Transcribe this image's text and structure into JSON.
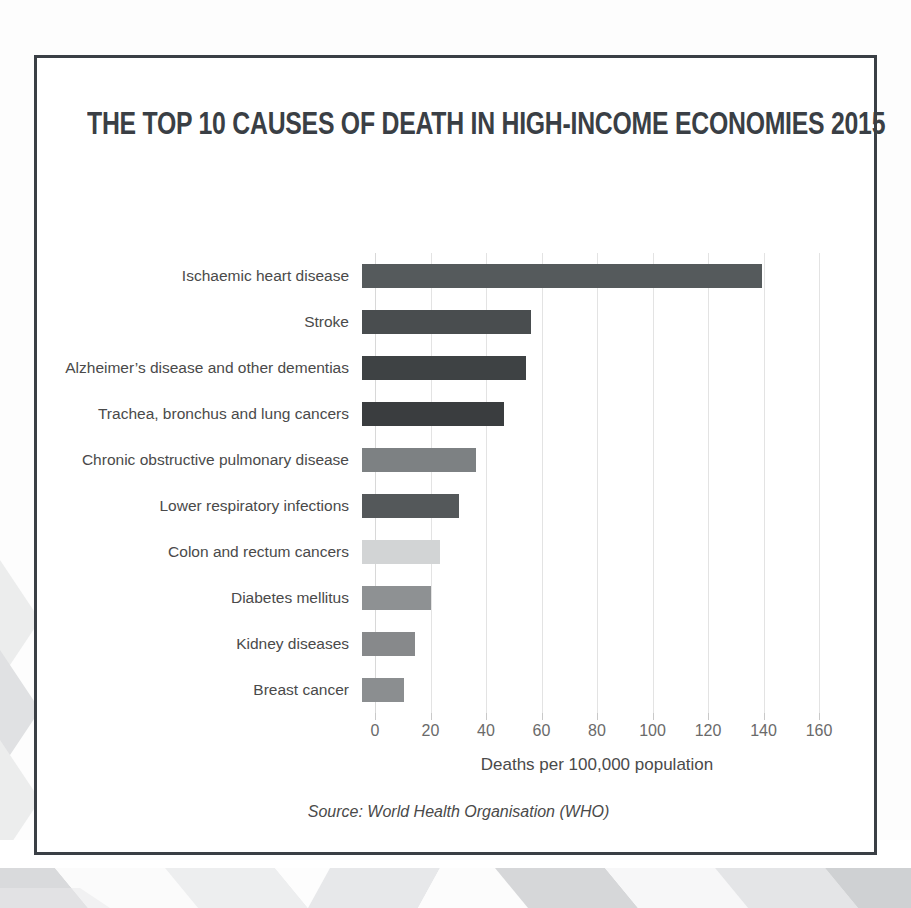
{
  "card": {
    "title": "THE TOP 10 CAUSES OF DEATH IN HIGH-INCOME ECONOMIES 2015",
    "source": "Source: World Health Organisation (WHO)"
  },
  "chart_data": {
    "type": "bar",
    "orientation": "horizontal",
    "title": "THE TOP 10 CAUSES OF DEATH IN HIGH-INCOME ECONOMIES 2015",
    "xlabel": "Deaths per 100,000  population",
    "ylabel": "",
    "xlim": [
      0,
      160
    ],
    "xticks": [
      0,
      20,
      40,
      60,
      80,
      100,
      120,
      140,
      160
    ],
    "xtick_labels": [
      "0",
      "20",
      "40",
      "60",
      "80",
      "100",
      "120",
      "140",
      "160"
    ],
    "grid": true,
    "grid_axis": "x",
    "legend": false,
    "source": "Source: World Health Organisation (WHO)",
    "categories": [
      "Ischaemic heart disease",
      "Stroke",
      "Alzheimer’s disease and other dementias",
      "Trachea, bronchus and lung cancers",
      "Chronic obstructive pulmonary disease",
      "Lower respiratory infections",
      "Colon and rectum cancers",
      "Diabetes mellitus",
      "Kidney diseases",
      "Breast cancer"
    ],
    "values": [
      144,
      61,
      59,
      51,
      41,
      35,
      28,
      25,
      19,
      15
    ],
    "bar_colors": [
      "#555a5c",
      "#494d4f",
      "#3e4244",
      "#3a3d3f",
      "#7d8183",
      "#54585a",
      "#d2d4d5",
      "#8e9193",
      "#87898b",
      "#8b8e90"
    ]
  },
  "decor": {
    "frame_color": "#3a3f45",
    "background_color": "#ffffff",
    "pattern_color_light": "#f2f2f3",
    "pattern_color_mid": "#dcdddf",
    "pattern_color_dark": "#c9cbcd"
  }
}
